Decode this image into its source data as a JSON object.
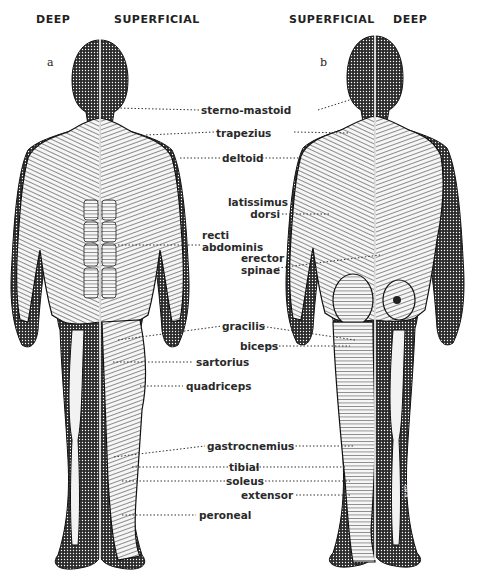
{
  "headers": {
    "a_left": "DEEP",
    "a_right": "SUPERFICIAL",
    "b_left": "SUPERFICIAL",
    "b_right": "DEEP"
  },
  "figures": {
    "a": {
      "label": "a",
      "view": "anterior"
    },
    "b": {
      "label": "b",
      "view": "posterior"
    }
  },
  "labels": [
    {
      "id": "sterno-mastoid",
      "text": "sterno-mastoid"
    },
    {
      "id": "trapezius",
      "text": "trapezius"
    },
    {
      "id": "deltoid",
      "text": "deltoid"
    },
    {
      "id": "latissimus-dorsi",
      "line1": "latissimus",
      "line2": "dorsi"
    },
    {
      "id": "recti-abdominis",
      "line1": "recti",
      "line2": "abdominis"
    },
    {
      "id": "erector-spinae",
      "line1": "erector",
      "line2": "spinae"
    },
    {
      "id": "gracilis",
      "text": "gracilis"
    },
    {
      "id": "biceps",
      "text": "biceps"
    },
    {
      "id": "sartorius",
      "text": "sartorius"
    },
    {
      "id": "quadriceps",
      "text": "quadriceps"
    },
    {
      "id": "gastrocnemius",
      "text": "gastrocnemius"
    },
    {
      "id": "tibial",
      "text": "tibial"
    },
    {
      "id": "soleus",
      "text": "soleus"
    },
    {
      "id": "extensor",
      "text": "extensor"
    },
    {
      "id": "peroneal",
      "text": "peroneal"
    }
  ],
  "colors": {
    "ink": "#1a1a1a",
    "stipple": "#3a3a3a",
    "muscle_fill": "#f2f2f2",
    "background": "#ffffff"
  }
}
